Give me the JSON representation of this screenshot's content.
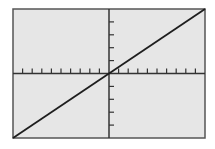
{
  "chart_data": {
    "type": "line",
    "title": "",
    "xlabel": "",
    "ylabel": "",
    "xlim": [
      -10,
      10
    ],
    "ylim": [
      -5,
      5
    ],
    "x_tick_step": 1,
    "y_tick_step": 1,
    "grid": false,
    "legend": null,
    "series": [
      {
        "name": "y = 0.5x",
        "x": [
          -10,
          10
        ],
        "values": [
          -5,
          5
        ]
      }
    ]
  },
  "colors": {
    "page_background": "#ffffff",
    "plot_background": "#e6e6e6",
    "frame": "#555555",
    "axes": "#333333",
    "line": "#1e1e1e"
  },
  "layout": {
    "frame": {
      "left": 13,
      "top": 9,
      "right": 205,
      "bottom": 138
    }
  }
}
